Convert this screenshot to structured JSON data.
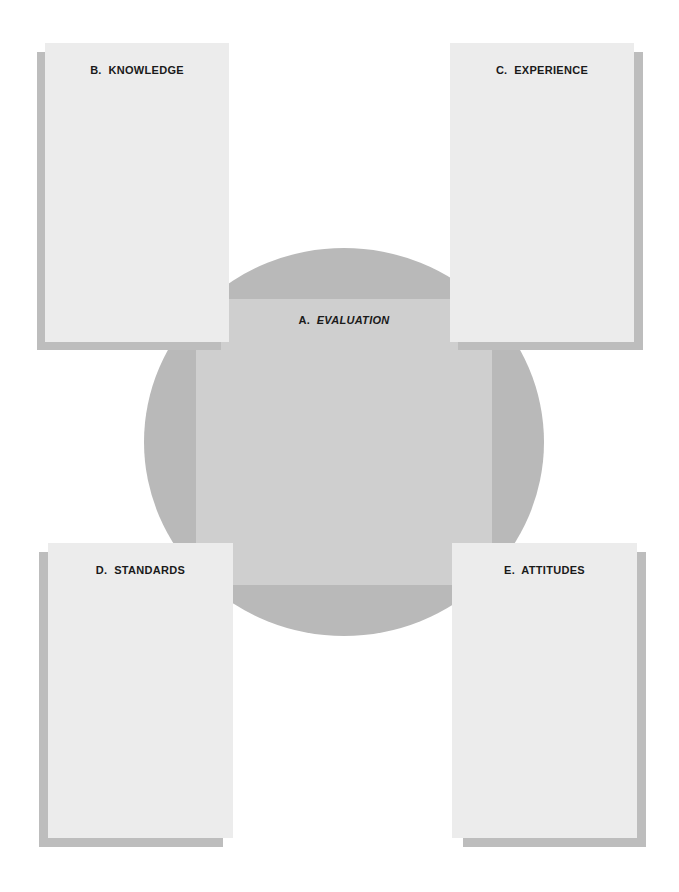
{
  "diagram": {
    "center": {
      "letter": "A.",
      "label": "EVALUATION"
    },
    "cards": [
      {
        "id": "B",
        "letter": "B.",
        "label": "KNOWLEDGE",
        "position": "top-left"
      },
      {
        "id": "C",
        "letter": "C.",
        "label": "EXPERIENCE",
        "position": "top-right"
      },
      {
        "id": "D",
        "letter": "D.",
        "label": "STANDARDS",
        "position": "bottom-left"
      },
      {
        "id": "E",
        "letter": "E.",
        "label": "ATTITUDES",
        "position": "bottom-right"
      }
    ],
    "colors": {
      "card_fill": "#ececec",
      "card_shadow": "#bdbdbd",
      "circle_fill": "#b9b9b9",
      "center_square_fill": "#cfcfcf",
      "text": "#1a1a1a"
    }
  }
}
